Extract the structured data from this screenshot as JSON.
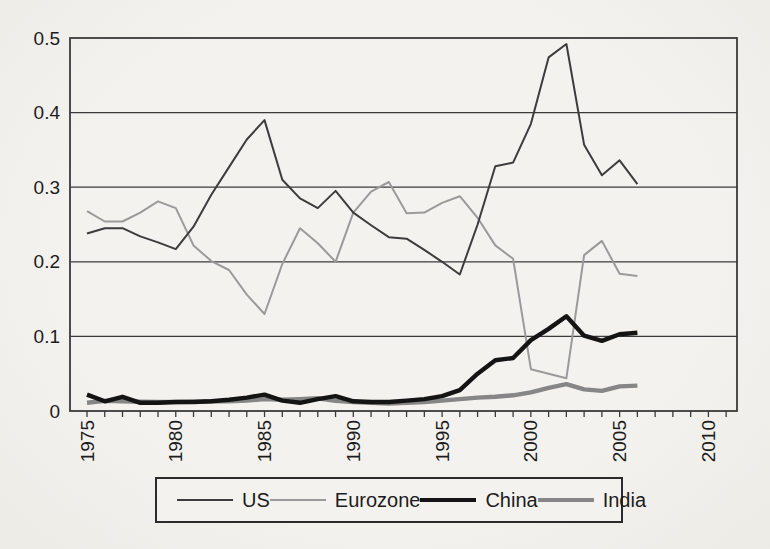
{
  "figure": {
    "background_color": "#f1efeb",
    "axis_color": "#3a3a3a",
    "text_color": "#1c1c1c"
  },
  "chart_data": {
    "type": "line",
    "title": "",
    "xlabel": "",
    "ylabel": "",
    "x": [
      1975,
      1976,
      1977,
      1978,
      1979,
      1980,
      1981,
      1982,
      1983,
      1984,
      1985,
      1986,
      1987,
      1988,
      1989,
      1990,
      1991,
      1992,
      1993,
      1994,
      1995,
      1996,
      1997,
      1998,
      1999,
      2000,
      2001,
      2002,
      2003,
      2004,
      2005,
      2006
    ],
    "series": [
      {
        "name": "US",
        "color": "#3c3c3c",
        "width": 2,
        "values": [
          0.238,
          0.245,
          0.245,
          0.234,
          0.226,
          0.217,
          0.247,
          0.29,
          0.327,
          0.364,
          0.39,
          0.31,
          0.285,
          0.272,
          0.295,
          0.266,
          0.249,
          0.233,
          0.231,
          0.216,
          0.2,
          0.183,
          0.25,
          0.328,
          0.333,
          0.385,
          0.474,
          0.492,
          0.357,
          0.316,
          0.336,
          0.304
        ]
      },
      {
        "name": "Eurozone",
        "color": "#9a9a9a",
        "width": 2,
        "values": [
          0.268,
          0.254,
          0.254,
          0.266,
          0.281,
          0.272,
          0.222,
          0.201,
          0.189,
          0.156,
          0.13,
          0.197,
          0.245,
          0.225,
          0.2,
          0.266,
          0.294,
          0.307,
          0.265,
          0.266,
          0.279,
          0.288,
          0.259,
          0.222,
          0.204,
          0.056,
          0.05,
          0.044,
          0.209,
          0.228,
          0.184,
          0.181
        ]
      },
      {
        "name": "China",
        "color": "#141414",
        "width": 4.4,
        "values": [
          0.022,
          0.013,
          0.019,
          0.011,
          0.011,
          0.012,
          0.012,
          0.013,
          0.015,
          0.018,
          0.022,
          0.014,
          0.011,
          0.016,
          0.02,
          0.013,
          0.012,
          0.012,
          0.014,
          0.016,
          0.02,
          0.028,
          0.05,
          0.068,
          0.071,
          0.095,
          0.11,
          0.127,
          0.101,
          0.094,
          0.103,
          0.105
        ]
      },
      {
        "name": "India",
        "color": "#868686",
        "width": 4.4,
        "values": [
          0.011,
          0.0135,
          0.013,
          0.0125,
          0.012,
          0.012,
          0.0125,
          0.013,
          0.013,
          0.014,
          0.016,
          0.015,
          0.016,
          0.017,
          0.0135,
          0.012,
          0.011,
          0.01,
          0.011,
          0.012,
          0.014,
          0.016,
          0.018,
          0.019,
          0.021,
          0.025,
          0.031,
          0.036,
          0.029,
          0.027,
          0.033,
          0.034
        ]
      }
    ],
    "ylim": [
      0,
      0.5
    ],
    "yticks": [
      "0",
      "0.1",
      "0.2",
      "0.3",
      "0.4",
      "0.5"
    ],
    "xticks": [
      "1975",
      "1980",
      "1985",
      "1990",
      "1995",
      "2000",
      "2005",
      "2010"
    ],
    "x_axis_range": [
      1974.0,
      2011.6
    ],
    "minor_tick_interval_years": 1,
    "grid": "horizontal",
    "legend_position": "bottom",
    "legend_entries": [
      "US",
      "Eurozone",
      "China",
      "India"
    ]
  }
}
